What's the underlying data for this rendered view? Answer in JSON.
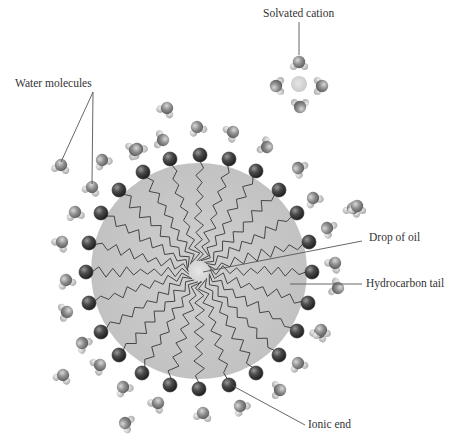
{
  "diagram": {
    "labels": {
      "solvated_cation": "Solvated cation",
      "water_molecules": "Water molecules",
      "drop_of_oil": "Drop of oil",
      "hydrocarbon_tail": "Hydrocarbon tail",
      "ionic_end": "Ionic end"
    },
    "colors": {
      "background": "#ffffff",
      "oil_drop": "#c4c4c4",
      "oil_center_glow": "#e2e2e2",
      "ionic_head": "#3e3e3e",
      "tail_line": "#404040",
      "water_oxygen": "#8f8f8f",
      "water_hydrogen": "#c8c8c8",
      "cation": "#d4d4d4",
      "leader_line": "#555555"
    },
    "micelle": {
      "center": [
        199,
        271
      ],
      "oil_radius": 108,
      "head_radius": 7
    },
    "ionic_heads": [
      [
        200,
        155
      ],
      [
        229,
        159
      ],
      [
        256,
        171
      ],
      [
        279,
        190
      ],
      [
        297,
        213
      ],
      [
        309,
        242
      ],
      [
        312,
        272
      ],
      [
        308,
        303
      ],
      [
        297,
        331
      ],
      [
        279,
        355
      ],
      [
        256,
        373
      ],
      [
        229,
        385
      ],
      [
        199,
        389
      ],
      [
        170,
        385
      ],
      [
        142,
        373
      ],
      [
        119,
        355
      ],
      [
        101,
        332
      ],
      [
        89,
        303
      ],
      [
        86,
        272
      ],
      [
        89,
        243
      ],
      [
        101,
        213
      ],
      [
        119,
        190
      ],
      [
        143,
        172
      ],
      [
        170,
        159
      ]
    ],
    "water_molecules": [
      [
        167,
        108,
        30
      ],
      [
        197,
        127,
        -20
      ],
      [
        233,
        132,
        60
      ],
      [
        163,
        140,
        100
      ],
      [
        137,
        149,
        -40
      ],
      [
        267,
        147,
        120
      ],
      [
        298,
        168,
        -60
      ],
      [
        61,
        165,
        10
      ],
      [
        102,
        160,
        -30
      ],
      [
        92,
        187,
        20
      ],
      [
        135,
        150,
        70
      ],
      [
        75,
        212,
        -10
      ],
      [
        62,
        242,
        40
      ],
      [
        66,
        280,
        -20
      ],
      [
        67,
        312,
        80
      ],
      [
        82,
        343,
        -50
      ],
      [
        63,
        375,
        20
      ],
      [
        100,
        365,
        60
      ],
      [
        123,
        387,
        -30
      ],
      [
        158,
        403,
        40
      ],
      [
        125,
        423,
        -70
      ],
      [
        203,
        413,
        10
      ],
      [
        240,
        406,
        -40
      ],
      [
        280,
        390,
        90
      ],
      [
        298,
        363,
        -20
      ],
      [
        320,
        332,
        30
      ],
      [
        313,
        198,
        -30
      ],
      [
        353,
        208,
        20
      ],
      [
        327,
        228,
        -60
      ],
      [
        335,
        263,
        40
      ],
      [
        338,
        288,
        110
      ],
      [
        321,
        330,
        -10
      ],
      [
        357,
        206,
        0
      ]
    ],
    "solvated_cation": {
      "center": [
        299,
        84
      ],
      "waters": [
        [
          299,
          62,
          0
        ],
        [
          276,
          86,
          -90
        ],
        [
          322,
          86,
          90
        ],
        [
          300,
          107,
          180
        ]
      ]
    },
    "leaders": {
      "solvated_cation": [
        [
          299,
          22
        ],
        [
          299,
          55
        ]
      ],
      "water_molecules": [
        [
          [
            93,
            92
          ],
          [
            61,
            162
          ]
        ],
        [
          [
            93,
            92
          ],
          [
            92,
            184
          ]
        ]
      ],
      "drop_of_oil": [
        [
          [
            203,
            272
          ],
          [
            362,
            241
          ]
        ]
      ],
      "hydrocarbon_tail": [
        [
          [
            290,
            284
          ],
          [
            362,
            284
          ]
        ]
      ],
      "ionic_end": [
        [
          [
            233,
            386
          ],
          [
            305,
            425
          ]
        ]
      ]
    }
  }
}
